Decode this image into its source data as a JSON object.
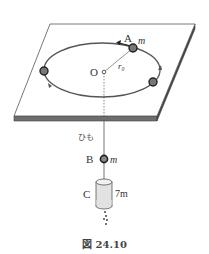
{
  "figure": {
    "caption": "図 24.10",
    "labels": {
      "point_A": "A",
      "mass_A": "m",
      "origin": "O",
      "radius": "r₀",
      "string": "ひも",
      "point_B": "B",
      "mass_B": "m",
      "point_C": "C",
      "mass_C": "7m"
    },
    "colors": {
      "plate_edge": "#555555",
      "plate_side": "#6e6e6e",
      "orbit": "#555555",
      "bob": "#333333",
      "cylinder_fill": "#e2e2e2"
    }
  }
}
